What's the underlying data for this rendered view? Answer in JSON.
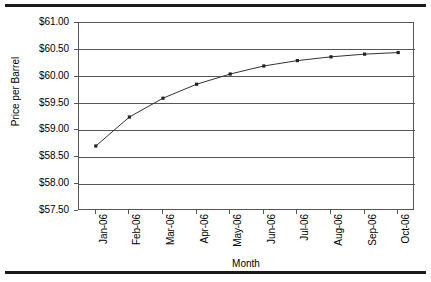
{
  "chart_data": {
    "type": "line",
    "title": "",
    "xlabel": "Month",
    "ylabel": "Price per Barrel",
    "categories": [
      "Jan-06",
      "Feb-06",
      "Mar-06",
      "Apr-06",
      "May-06",
      "Jun-06",
      "Jul-06",
      "Aug-06",
      "Sep-06",
      "Oct-06"
    ],
    "values": [
      58.71,
      59.25,
      59.6,
      59.86,
      60.05,
      60.2,
      60.3,
      60.37,
      60.42,
      60.45
    ],
    "series": [
      {
        "name": "Price per Barrel",
        "values": [
          58.71,
          59.25,
          59.6,
          59.86,
          60.05,
          60.2,
          60.3,
          60.37,
          60.42,
          60.45
        ]
      }
    ],
    "ylim": [
      57.5,
      61.0
    ],
    "ytick_step": 0.5,
    "ytick_labels": [
      "$61.00",
      "$60.50",
      "$60.00",
      "$59.50",
      "$59.00",
      "$58.50",
      "$58.00",
      "$57.50"
    ],
    "ytick_values": [
      61.0,
      60.5,
      60.0,
      59.5,
      59.0,
      58.5,
      58.0,
      57.5
    ],
    "grid": "horizontal",
    "legend": "none",
    "marker": "square",
    "line_color": "#333333",
    "marker_color": "#222222",
    "grid_color": "#555555",
    "plot_background": "#ffffff"
  }
}
